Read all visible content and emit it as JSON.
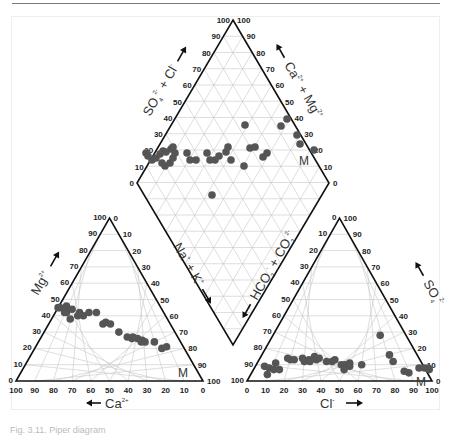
{
  "figure": {
    "caption": "Fig. 3.11. Piper diagram",
    "colors": {
      "point": "#555555",
      "outline": "#111111",
      "grid": "#c8c8c8",
      "text": "#222222",
      "label": "#333333"
    }
  },
  "chart_data": {
    "type": "scatter",
    "subtype": "piper-trilinear",
    "title": "",
    "panels": [
      {
        "name": "cation-triangle",
        "bottom_axis": {
          "label": "Ca2+",
          "arrow": "left",
          "ticks": [
            100,
            90,
            80,
            70,
            60,
            50,
            40,
            30,
            20,
            10,
            0
          ]
        },
        "left_axis": {
          "label": "Mg2+",
          "arrow": "up",
          "ticks": [
            0,
            10,
            20,
            30,
            40,
            50,
            60,
            70,
            80,
            90,
            100
          ]
        },
        "right_axis": {
          "label": "Na+ + K+",
          "arrow": "down",
          "ticks": [
            0,
            10,
            20,
            30,
            40,
            50,
            60,
            70,
            80,
            90,
            100
          ]
        },
        "annotation": "M",
        "points_ca_mg": [
          [
            54,
            45
          ],
          [
            50,
            46
          ],
          [
            52,
            44
          ],
          [
            55,
            45
          ],
          [
            52,
            42
          ],
          [
            48,
            44
          ],
          [
            53,
            42
          ],
          [
            47,
            40
          ],
          [
            52,
            38
          ],
          [
            45,
            42
          ],
          [
            40,
            42
          ],
          [
            44,
            40
          ],
          [
            36,
            42
          ],
          [
            34,
            36
          ],
          [
            36,
            35
          ],
          [
            32,
            35
          ],
          [
            30,
            30
          ],
          [
            27,
            27
          ],
          [
            25,
            26
          ],
          [
            24,
            27
          ],
          [
            22,
            26
          ],
          [
            20,
            25
          ],
          [
            21,
            24
          ],
          [
            19,
            24
          ],
          [
            14,
            24
          ],
          [
            12,
            20
          ],
          [
            9,
            21
          ]
        ]
      },
      {
        "name": "anion-triangle",
        "bottom_axis": {
          "label": "Cl-",
          "arrow": "right",
          "ticks": [
            0,
            10,
            20,
            30,
            40,
            50,
            60,
            70,
            80,
            90,
            100
          ]
        },
        "left_axis": {
          "label": "HCO3- + CO3 2-",
          "arrow": "down",
          "ticks": [
            0,
            10,
            20,
            30,
            40,
            50,
            60,
            70,
            80,
            90,
            100
          ]
        },
        "right_axis": {
          "label": "SO4 2-",
          "arrow": "up",
          "ticks": [
            0,
            10,
            20,
            30,
            40,
            50,
            60,
            70,
            80,
            90,
            100
          ]
        },
        "annotation": "M",
        "points_cl_so4": [
          [
            5,
            9
          ],
          [
            8,
            8
          ],
          [
            10,
            11
          ],
          [
            11,
            7
          ],
          [
            9,
            4
          ],
          [
            14,
            7
          ],
          [
            15,
            14
          ],
          [
            17,
            13
          ],
          [
            19,
            13
          ],
          [
            23,
            14
          ],
          [
            25,
            12
          ],
          [
            27,
            13
          ],
          [
            28,
            12
          ],
          [
            29,
            15
          ],
          [
            31,
            13
          ],
          [
            32,
            14
          ],
          [
            37,
            12
          ],
          [
            40,
            12
          ],
          [
            41,
            13
          ],
          [
            46,
            10
          ],
          [
            48,
            10
          ],
          [
            50,
            11
          ],
          [
            51,
            9
          ],
          [
            49,
            7
          ],
          [
            57,
            10
          ],
          [
            58,
            28
          ],
          [
            69,
            16
          ],
          [
            73,
            12
          ],
          [
            82,
            6
          ],
          [
            85,
            5
          ],
          [
            89,
            8
          ],
          [
            92,
            8
          ],
          [
            94,
            8
          ],
          [
            95,
            7
          ]
        ]
      },
      {
        "name": "diamond",
        "left_upper_axis": {
          "label": "SO4 2- + Cl-",
          "arrow": "up",
          "ticks": [
            0,
            10,
            20,
            30,
            40,
            50,
            60,
            70,
            80,
            90,
            100
          ]
        },
        "right_upper_axis": {
          "label": "Ca2+ + Mg2+",
          "arrow": "up",
          "ticks": [
            0,
            10,
            20,
            30,
            40,
            50,
            60,
            70,
            80,
            90,
            100
          ]
        },
        "left_lower_axis": {
          "label": "Na+ + K+",
          "arrow": "down"
        },
        "right_lower_axis": {
          "label": "HCO3- + CO3 2-",
          "arrow": "down"
        },
        "annotation": "M",
        "points_px": [
          [
            146,
            153
          ],
          [
            148,
            156
          ],
          [
            152,
            160
          ],
          [
            156,
            158
          ],
          [
            160,
            154
          ],
          [
            163,
            151
          ],
          [
            166,
            152
          ],
          [
            171,
            149
          ],
          [
            173,
            147
          ],
          [
            162,
            163
          ],
          [
            165,
            166
          ],
          [
            170,
            163
          ],
          [
            173,
            158
          ],
          [
            175,
            153
          ],
          [
            187,
            153
          ],
          [
            190,
            160
          ],
          [
            196,
            160
          ],
          [
            207,
            153
          ],
          [
            210,
            160
          ],
          [
            215,
            160
          ],
          [
            219,
            156
          ],
          [
            226,
            152
          ],
          [
            228,
            147
          ],
          [
            231,
            160
          ],
          [
            245,
            125
          ],
          [
            244,
            166
          ],
          [
            250,
            148
          ],
          [
            255,
            147
          ],
          [
            263,
            157
          ],
          [
            267,
            153
          ],
          [
            281,
            126
          ],
          [
            287,
            119
          ],
          [
            297,
            135
          ],
          [
            300,
            144
          ],
          [
            314,
            150
          ],
          [
            212,
            195
          ]
        ]
      }
    ],
    "legend": null,
    "grid": true
  },
  "labels": {
    "cation_bottom": "Ca",
    "cation_bottom_sup": "2+",
    "cation_left": "Mg",
    "cation_left_sup": "2+",
    "anion_bottom": "Cl",
    "anion_bottom_sup": "-",
    "anion_right": "SO",
    "anion_right_sub": "4",
    "anion_right_sup": "2-",
    "anion_left": "HCO",
    "anion_left_sub": "3",
    "anion_left_sup": "-",
    "anion_left_plus": " + CO",
    "anion_left_sub2": "3",
    "anion_left_sup2": "2-",
    "diamond_left": "SO",
    "diamond_left_sub": "4",
    "diamond_left_sup": "2-",
    "diamond_left_plus": " + Cl",
    "diamond_left_sup2": "-",
    "diamond_right": "Ca",
    "diamond_right_sup": "2+",
    "diamond_right_plus": " + Mg",
    "diamond_right_sup2": "2+",
    "nak": "Na",
    "nak_sup": "+",
    "nak_plus": " + K",
    "nak_sup2": "+",
    "m": "M"
  }
}
